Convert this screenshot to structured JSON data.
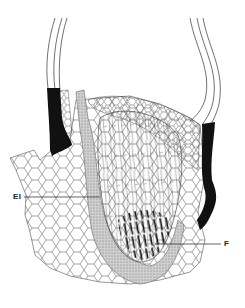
{
  "figure": {
    "type": "histological-section-line-drawing",
    "background": "#ffffff",
    "ink_color": "#1a1a1a",
    "stipple_color": "#9a9a9a",
    "labels": [
      {
        "text": "EI",
        "x": 13,
        "y": 193,
        "leader_to": [
          100,
          197
        ]
      },
      {
        "text": "F",
        "x": 224,
        "y": 240,
        "leader_to": [
          155,
          244
        ]
      }
    ]
  }
}
